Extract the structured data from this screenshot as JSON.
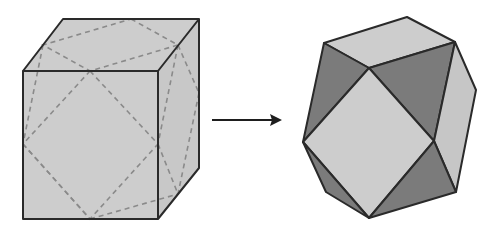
{
  "diagram": {
    "left_shape": {
      "name": "cube",
      "description": "Cube with dashed lines joining edge midpoints"
    },
    "arrow": {
      "direction": "right",
      "meaning": "transforms into"
    },
    "right_shape": {
      "name": "cuboctahedron",
      "description": "Polyhedron with square and triangular faces"
    },
    "colors": {
      "light_face": "#cdcdcd",
      "dark_face": "#7b7b7b",
      "mid_face": "#bdbdbd",
      "edge": "#2a2a2a",
      "dashed": "#8a8a8a",
      "arrow": "#1e1e1e"
    }
  }
}
